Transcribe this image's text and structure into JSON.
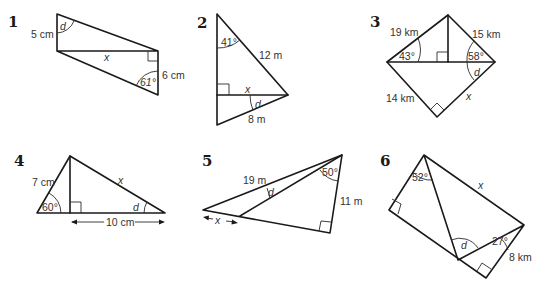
{
  "problems": [
    {
      "number": "1",
      "labels": {
        "side_left": "5 cm",
        "side_right": "6 cm",
        "unknown_side": "x",
        "given_angle": "61°",
        "unknown_angle": "d"
      }
    },
    {
      "number": "2",
      "labels": {
        "hypotenuse_top": "12 m",
        "side_bottom": "8 m",
        "unknown_side": "x",
        "given_angle": "41°",
        "unknown_angle": "d"
      }
    },
    {
      "number": "3",
      "labels": {
        "side_top_left": "19 km",
        "side_top_right": "15 km",
        "side_bottom_left": "14 km",
        "unknown_side": "x",
        "angle_left": "43°",
        "angle_right": "58°",
        "unknown_angle": "d"
      }
    },
    {
      "number": "4",
      "labels": {
        "side_left": "7 cm",
        "base": "10 cm",
        "unknown_side": "x",
        "given_angle": "60°",
        "unknown_angle": "d"
      }
    },
    {
      "number": "5",
      "labels": {
        "side_long": "19 m",
        "side_right": "11 m",
        "unknown_side": "x",
        "given_angle": "50°",
        "unknown_angle": "d"
      }
    },
    {
      "number": "6",
      "labels": {
        "side_right": "8 km",
        "unknown_side": "x",
        "angle_top": "52°",
        "angle_right": "27°",
        "unknown_angle": "d"
      }
    }
  ]
}
